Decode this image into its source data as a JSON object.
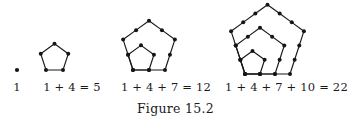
{
  "figure": {
    "caption": "Figure 15.2",
    "background_color": "#ffffff",
    "ink_color": "#1a1a1a"
  },
  "chart_data": {
    "type": "diagram",
    "title": "Figure 15.2",
    "categories": [
      "stage 1",
      "stage 2",
      "stage 3",
      "stage 4"
    ],
    "values": [
      1,
      5,
      12,
      22
    ],
    "series": [
      {
        "name": "dots added per ring",
        "values": [
          1,
          4,
          7,
          10
        ]
      },
      {
        "name": "cumulative pentagonal number",
        "values": [
          1,
          5,
          12,
          22
        ]
      }
    ],
    "labels": [
      "1",
      "1 + 4 = 5",
      "1 + 4 + 7 = 12",
      "1 + 4 + 7 + 10 = 22"
    ],
    "xlabel": "",
    "ylabel": "",
    "grid": false,
    "legend": "none"
  },
  "panels": [
    {
      "id": "pentagonal-1",
      "label": "1",
      "dot_count": 1,
      "rings": 0,
      "left": 0,
      "width": 34,
      "geometry": {
        "scale": 0,
        "origin_x": 17,
        "origin_y": 70,
        "points": [
          [
            17,
            70
          ]
        ],
        "edges": []
      }
    },
    {
      "id": "pentagonal-5",
      "label": "1 + 4 = 5",
      "dot_count": 5,
      "rings": 1,
      "left": 34,
      "width": 76,
      "geometry": {
        "scale": 17,
        "origin_x": 46,
        "origin_y": 70,
        "points": [
          [
            46,
            70
          ],
          [
            63,
            70
          ],
          [
            68.25,
            53.83
          ],
          [
            54.5,
            43.83
          ],
          [
            40.75,
            53.83
          ]
        ],
        "edges": [
          [
            0,
            1
          ],
          [
            1,
            2
          ],
          [
            2,
            3
          ],
          [
            3,
            4
          ],
          [
            4,
            0
          ]
        ]
      }
    },
    {
      "id": "pentagonal-12",
      "label": "1 + 4 + 7 = 12",
      "dot_count": 12,
      "rings": 2,
      "left": 110,
      "width": 112,
      "geometry": {
        "scale": 16,
        "origin_x": 133,
        "origin_y": 70,
        "inner_points": [
          [
            133,
            70
          ],
          [
            149,
            70
          ],
          [
            153.94,
            54.78
          ],
          [
            141,
            45.37
          ],
          [
            128.06,
            54.78
          ]
        ],
        "outer_points": [
          [
            133,
            70
          ],
          [
            149,
            70
          ],
          [
            165,
            70
          ],
          [
            169.94,
            54.78
          ],
          [
            174.88,
            39.56
          ],
          [
            161.94,
            30.15
          ],
          [
            149,
            20.74
          ],
          [
            136.06,
            30.15
          ],
          [
            123.12,
            39.56
          ],
          [
            128.06,
            54.78
          ]
        ]
      }
    },
    {
      "id": "pentagonal-22",
      "label": "1 + 4 + 7 + 10 = 22",
      "dot_count": 22,
      "rings": 3,
      "left": 222,
      "width": 129,
      "geometry": {
        "scale": 15,
        "origin_x": 245,
        "origin_y": 74,
        "ring1_points": [
          [
            245,
            74
          ],
          [
            260,
            74
          ],
          [
            264.64,
            59.73
          ],
          [
            252.5,
            50.91
          ],
          [
            240.36,
            59.73
          ]
        ],
        "ring2_points": [
          [
            245,
            74
          ],
          [
            260,
            74
          ],
          [
            275,
            74
          ],
          [
            279.64,
            59.73
          ],
          [
            284.27,
            45.46
          ],
          [
            272.14,
            36.64
          ],
          [
            260,
            27.82
          ],
          [
            247.86,
            36.64
          ],
          [
            235.73,
            45.46
          ],
          [
            240.36,
            59.73
          ]
        ],
        "ring3_points": [
          [
            245,
            74
          ],
          [
            260,
            74
          ],
          [
            275,
            74
          ],
          [
            290,
            74
          ],
          [
            294.64,
            59.73
          ],
          [
            299.27,
            45.46
          ],
          [
            303.91,
            31.19
          ],
          [
            291.77,
            22.37
          ],
          [
            279.64,
            13.55
          ],
          [
            267.5,
            4.73
          ],
          [
            255.36,
            13.55
          ],
          [
            243.23,
            22.37
          ],
          [
            231.09,
            31.19
          ],
          [
            235.73,
            45.46
          ],
          [
            240.36,
            59.73
          ]
        ]
      }
    }
  ]
}
